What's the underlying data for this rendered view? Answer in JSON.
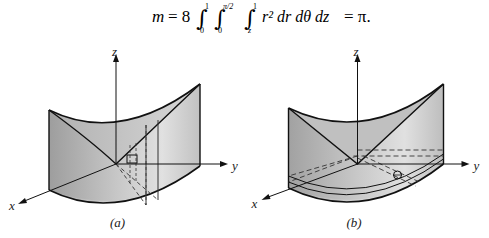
{
  "equation": {
    "lhs": "m",
    "equals": "= 8",
    "integrals": [
      {
        "lower": "0",
        "upper": "1"
      },
      {
        "lower": "0",
        "upper": "π/2"
      },
      {
        "lower": "z",
        "upper": "1"
      }
    ],
    "integrand": "r² dr dθ dz",
    "result": "= π."
  },
  "figures": [
    {
      "id": "a",
      "caption": "(a)",
      "axes": {
        "x": "x",
        "y": "y",
        "z": "z"
      }
    },
    {
      "id": "b",
      "caption": "(b)",
      "axes": {
        "x": "x",
        "y": "y",
        "z": "z"
      }
    }
  ]
}
